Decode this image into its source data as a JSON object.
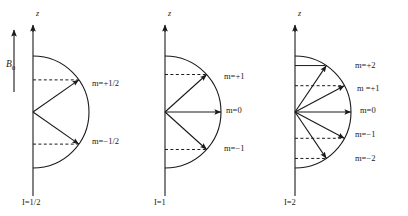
{
  "figure": {
    "type": "vector-model-diagram",
    "background_color": "#ffffff",
    "line_color": "#1a1a1a",
    "field_label": "B",
    "field_subscript": "0",
    "axis_label": "z"
  },
  "panels": [
    {
      "id": "panel-i-half",
      "spin_label": "I=1/2",
      "spin_symbol": "I",
      "spin_value": "1/2",
      "axis_x": 33,
      "axis_top": 22,
      "axis_bottom": 196,
      "origin_y": 112,
      "radius": 56,
      "has_field_arrow": true,
      "states": [
        {
          "m_label": "m=+1/2",
          "m_value": "+1/2",
          "angle_deg": -35,
          "guide": "dashed",
          "label_x": 92,
          "label_y": 83
        },
        {
          "m_label": "m=−1/2",
          "m_value": "-1/2",
          "angle_deg": 35,
          "guide": "dashed",
          "label_x": 92,
          "label_y": 141
        }
      ]
    },
    {
      "id": "panel-i-one",
      "spin_label": "I=1",
      "spin_symbol": "I",
      "spin_value": "1",
      "axis_x": 165,
      "axis_top": 22,
      "axis_bottom": 196,
      "origin_y": 112,
      "radius": 56,
      "has_field_arrow": false,
      "states": [
        {
          "m_label": "m=+1",
          "m_value": "+1",
          "angle_deg": -42,
          "guide": "dashed",
          "label_x": 224,
          "label_y": 76
        },
        {
          "m_label": "m=0",
          "m_value": "0",
          "angle_deg": 0,
          "guide": "none",
          "label_x": 226,
          "label_y": 110
        },
        {
          "m_label": "m=−1",
          "m_value": "-1",
          "angle_deg": 42,
          "guide": "dashed",
          "label_x": 224,
          "label_y": 148
        }
      ]
    },
    {
      "id": "panel-i-two",
      "spin_label": "I=2",
      "spin_symbol": "I",
      "spin_value": "2",
      "axis_x": 295,
      "axis_top": 22,
      "axis_bottom": 196,
      "origin_y": 112,
      "radius": 56,
      "has_field_arrow": false,
      "states": [
        {
          "m_label": "m=+2",
          "m_value": "+2",
          "angle_deg": -56,
          "guide": "solid",
          "label_x": 355,
          "label_y": 65
        },
        {
          "m_label": "m =+1",
          "m_value": "+1",
          "angle_deg": -28,
          "guide": "dashed",
          "label_x": 357,
          "label_y": 88
        },
        {
          "m_label": "m=0",
          "m_value": "0",
          "angle_deg": 0,
          "guide": "none",
          "label_x": 360,
          "label_y": 110
        },
        {
          "m_label": "m=−1",
          "m_value": "-1",
          "angle_deg": 28,
          "guide": "dashed",
          "label_x": 355,
          "label_y": 134
        },
        {
          "m_label": "m=−2",
          "m_value": "-2",
          "angle_deg": 56,
          "guide": "dashed",
          "label_x": 355,
          "label_y": 158
        }
      ]
    }
  ]
}
